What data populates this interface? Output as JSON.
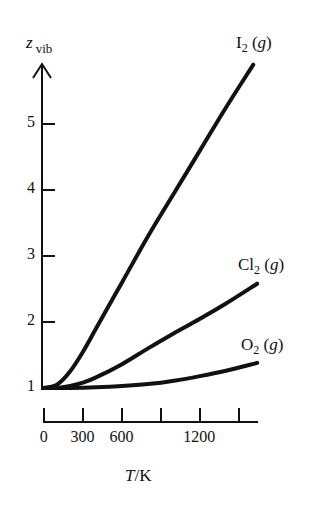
{
  "chart_data": {
    "type": "line",
    "title": "",
    "xlabel": "T/K",
    "ylabel": "z_vib",
    "x_ticks": [
      0,
      300,
      600,
      900,
      1200,
      1500
    ],
    "x_tick_labels": [
      "0",
      "300",
      "600",
      "",
      "1200",
      ""
    ],
    "y_ticks": [
      1,
      2,
      3,
      4,
      5
    ],
    "y_tick_labels": [
      "1",
      "2",
      "3",
      "4",
      "5"
    ],
    "xlim": [
      0,
      1650
    ],
    "ylim": [
      1,
      6.3
    ],
    "grid": false,
    "legend": "inline labels at line ends",
    "series": [
      {
        "name": "I2(g)",
        "x": [
          0,
          100,
          200,
          300,
          400,
          600,
          800,
          1000,
          1200,
          1400,
          1610
        ],
        "y": [
          1.0,
          1.05,
          1.25,
          1.55,
          1.9,
          2.6,
          3.3,
          3.95,
          4.6,
          5.25,
          5.9
        ]
      },
      {
        "name": "Cl2(g)",
        "x": [
          0,
          100,
          200,
          300,
          400,
          600,
          800,
          1000,
          1200,
          1400,
          1640
        ],
        "y": [
          1.0,
          1.0,
          1.03,
          1.08,
          1.16,
          1.36,
          1.6,
          1.83,
          2.05,
          2.28,
          2.58
        ]
      },
      {
        "name": "O2(g)",
        "x": [
          0,
          200,
          400,
          600,
          800,
          1000,
          1200,
          1400,
          1640
        ],
        "y": [
          1.0,
          1.0,
          1.01,
          1.03,
          1.06,
          1.11,
          1.18,
          1.26,
          1.38
        ]
      }
    ]
  },
  "labels": {
    "y_axis_main": "z",
    "y_axis_sub": "vib",
    "x_axis_italic": "T",
    "x_axis_rest": "/K",
    "series_labels": [
      {
        "main": "I",
        "sub": "2",
        "rest": " (",
        "g": "g",
        "close": ")"
      },
      {
        "main": "Cl",
        "sub": "2",
        "rest": " (",
        "g": "g",
        "close": ")"
      },
      {
        "main": "O",
        "sub": "2",
        "rest": " (",
        "g": "g",
        "close": ")"
      }
    ]
  },
  "colors": {
    "line": "#111111",
    "background": "#ffffff"
  }
}
